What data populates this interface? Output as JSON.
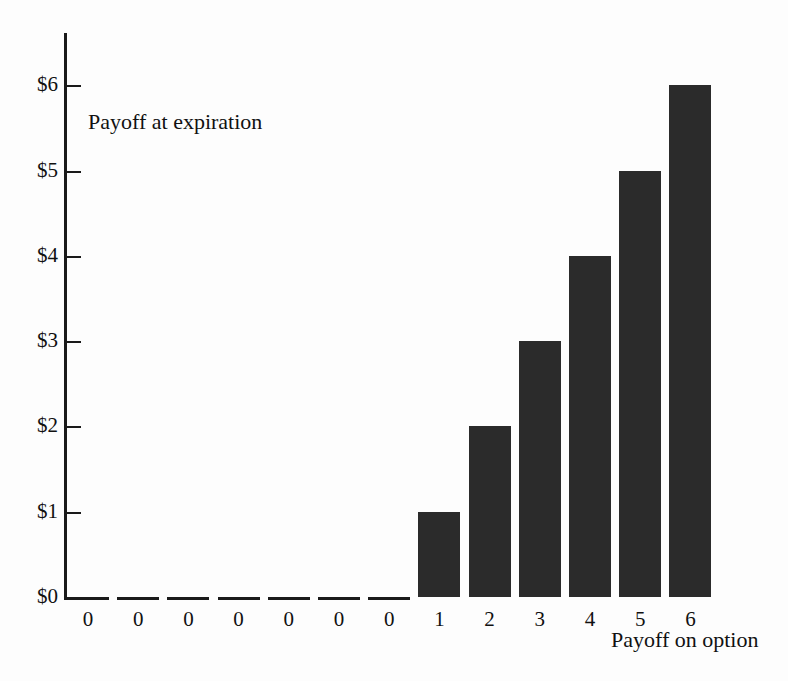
{
  "chart_data": {
    "type": "bar",
    "title": "",
    "annotations": [
      {
        "text": "Payoff at expiration",
        "role": "series-label"
      },
      {
        "text": "Payoff on option",
        "role": "x-axis-label"
      }
    ],
    "xlabel": "Payoff on option",
    "ylabel": "Payoff at expiration",
    "categories": [
      "0",
      "0",
      "0",
      "0",
      "0",
      "0",
      "0",
      "1",
      "2",
      "3",
      "4",
      "5",
      "6"
    ],
    "values": [
      0,
      0,
      0,
      0,
      0,
      0,
      0,
      1,
      2,
      3,
      4,
      5,
      6
    ],
    "ylim": [
      0,
      6
    ],
    "ytick_values": [
      0,
      1,
      2,
      3,
      4,
      5,
      6
    ],
    "ytick_labels": [
      "$0",
      "$1",
      "$2",
      "$3",
      "$4",
      "$5",
      "$6"
    ],
    "xtick_labels": [
      "0",
      "0",
      "0",
      "0",
      "0",
      "0",
      "0",
      "1",
      "2",
      "3",
      "4",
      "5",
      "6"
    ],
    "grid": false,
    "legend": false,
    "bar_color": "#2b2b2b",
    "axis_color": "#1a1a1a",
    "background_color": "#fdfdfd"
  },
  "geometry": {
    "axis_x": 64,
    "axis_top": 33,
    "baseline_y": 597,
    "px_per_unit": 85.3,
    "bar_width": 42,
    "bar_pitch": 50.2,
    "first_bar_left": 67,
    "ytick_length": 14,
    "ylabel_right": 58
  }
}
